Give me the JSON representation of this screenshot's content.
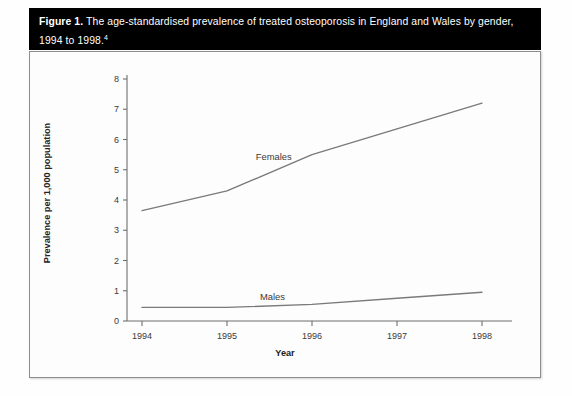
{
  "figure": {
    "label": "Figure 1.",
    "caption": " The age-standardised prevalence of treated osteoporosis in England and Wales by gender, 1994 to 1998.",
    "footnote_marker": "4"
  },
  "chart_data": {
    "type": "line",
    "title": "The age-standardised prevalence of treated osteoporosis in England and Wales by gender, 1994 to 1998.",
    "xlabel": "Year",
    "ylabel": "Prevalence per 1,000 population",
    "categories": [
      "1994",
      "1995",
      "1996",
      "1997",
      "1998"
    ],
    "x": [
      1994,
      1995,
      1996,
      1997,
      1998
    ],
    "series": [
      {
        "name": "Females",
        "values": [
          3.65,
          4.3,
          5.5,
          6.35,
          7.2
        ],
        "color": "#7a7a7a"
      },
      {
        "name": "Males",
        "values": [
          0.45,
          0.45,
          0.55,
          0.75,
          0.95
        ],
        "color": "#7a7a7a"
      }
    ],
    "ylim": [
      0,
      8
    ],
    "yticks": [
      "0",
      "1",
      "2",
      "3",
      "4",
      "5",
      "6",
      "7",
      "8"
    ],
    "xticks": [
      "1994",
      "1995",
      "1996",
      "1997",
      "1998"
    ],
    "grid": false,
    "legend": "inline-series-labels",
    "annotations": [
      {
        "text": "Females",
        "series": "Females"
      },
      {
        "text": "Males",
        "series": "Males"
      }
    ]
  },
  "colors": {
    "title_bar_background": "#000000",
    "title_bar_text": "#ffffff",
    "panel_background": "#fdfdfd",
    "panel_border": "#8d8d8d",
    "axis": "#6f6f6f",
    "line": "#7a7a7a",
    "tick_text": "#3a3a3a"
  }
}
